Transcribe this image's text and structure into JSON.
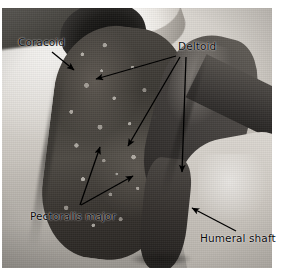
{
  "figure": {
    "kind": "annotated-anatomical-photograph",
    "plate": {
      "x": 2,
      "y": 8,
      "width": 270,
      "height": 260,
      "background": "#ffffff"
    },
    "palette": {
      "label_text": "#0a0a0a",
      "arrow": "#000000",
      "skin_light": "#e9e6e1",
      "skin_mid": "#bfbab3",
      "muscle_dark": "#3b3833",
      "cavity_black": "#0e0d0c",
      "page_white": "#ffffff"
    }
  },
  "labels": [
    {
      "id": "coracoid",
      "text": "Coracoid",
      "x": 18,
      "y": 36,
      "arrows": [
        {
          "x1": 52,
          "y1": 52,
          "x2": 74,
          "y2": 70
        }
      ]
    },
    {
      "id": "deltoid",
      "text": "Deltoid",
      "x": 178,
      "y": 40,
      "arrows": [
        {
          "x1": 176,
          "y1": 56,
          "x2": 96,
          "y2": 79
        },
        {
          "x1": 180,
          "y1": 57,
          "x2": 128,
          "y2": 146
        },
        {
          "x1": 186,
          "y1": 57,
          "x2": 182,
          "y2": 172
        }
      ]
    },
    {
      "id": "pectoralis-major",
      "text": "Pectoralis major",
      "x": 30,
      "y": 210,
      "arrows": [
        {
          "x1": 80,
          "y1": 205,
          "x2": 100,
          "y2": 147
        },
        {
          "x1": 81,
          "y1": 205,
          "x2": 133,
          "y2": 176
        }
      ]
    },
    {
      "id": "humeral-shaft",
      "text": "Humeral shaft",
      "x": 200,
      "y": 232,
      "arrows": [
        {
          "x1": 236,
          "y1": 231,
          "x2": 192,
          "y2": 208
        }
      ]
    }
  ]
}
